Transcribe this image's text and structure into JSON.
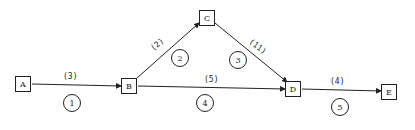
{
  "diagram": {
    "type": "activity-network",
    "nodes": [
      {
        "id": "A",
        "label": "A"
      },
      {
        "id": "B",
        "label": "B"
      },
      {
        "id": "C",
        "label": "C"
      },
      {
        "id": "D",
        "label": "D"
      },
      {
        "id": "E",
        "label": "E"
      }
    ],
    "edges": [
      {
        "from": "A",
        "to": "B",
        "duration": "(3)",
        "activity": "1"
      },
      {
        "from": "B",
        "to": "C",
        "duration": "(2)",
        "activity": "2"
      },
      {
        "from": "C",
        "to": "D",
        "duration": "(11)",
        "activity": "3"
      },
      {
        "from": "B",
        "to": "D",
        "duration": "(5)",
        "activity": "4"
      },
      {
        "from": "D",
        "to": "E",
        "duration": "(4)",
        "activity": "5"
      }
    ]
  }
}
